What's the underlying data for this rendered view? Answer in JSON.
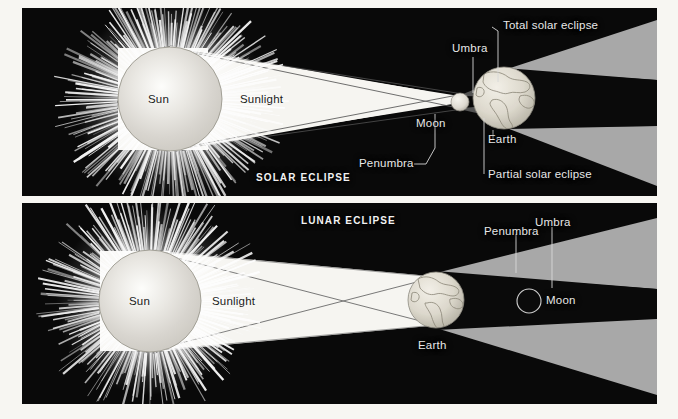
{
  "figure": {
    "background_color": "#f7f6f2",
    "panel_background": "#090909",
    "label_color": "#e8e8e8",
    "umbra_color": "#0a0a0a",
    "penumbra_color": "#a8a8a8",
    "sunlight_color": "#f6f5f1"
  },
  "panels": [
    {
      "id": "solar-eclipse",
      "title": "SOLAR ECLIPSE",
      "bodies": [
        {
          "name": "Sun",
          "label": "Sun"
        },
        {
          "name": "Moon",
          "label": "Moon"
        },
        {
          "name": "Earth",
          "label": "Earth"
        }
      ],
      "labels": [
        {
          "name": "sunlight",
          "text": "Sunlight"
        },
        {
          "name": "umbra",
          "text": "Umbra"
        },
        {
          "name": "penumbra",
          "text": "Penumbra"
        },
        {
          "name": "total-solar-eclipse",
          "text": "Total solar eclipse"
        },
        {
          "name": "partial-solar-eclipse",
          "text": "Partial solar eclipse"
        }
      ]
    },
    {
      "id": "lunar-eclipse",
      "title": "LUNAR ECLIPSE",
      "bodies": [
        {
          "name": "Sun",
          "label": "Sun"
        },
        {
          "name": "Earth",
          "label": "Earth"
        },
        {
          "name": "Moon",
          "label": "Moon"
        }
      ],
      "labels": [
        {
          "name": "sunlight",
          "text": "Sunlight"
        },
        {
          "name": "penumbra",
          "text": "Penumbra"
        },
        {
          "name": "umbra",
          "text": "Umbra"
        }
      ]
    }
  ],
  "solar": {
    "title": "SOLAR ECLIPSE",
    "sun": "Sun",
    "sunlight": "Sunlight",
    "moon": "Moon",
    "earth": "Earth",
    "umbra": "Umbra",
    "penumbra": "Penumbra",
    "total": "Total solar eclipse",
    "partial": "Partial solar eclipse"
  },
  "lunar": {
    "title": "LUNAR ECLIPSE",
    "sun": "Sun",
    "sunlight": "Sunlight",
    "earth": "Earth",
    "moon": "Moon",
    "penumbra": "Penumbra",
    "umbra": "Umbra"
  }
}
